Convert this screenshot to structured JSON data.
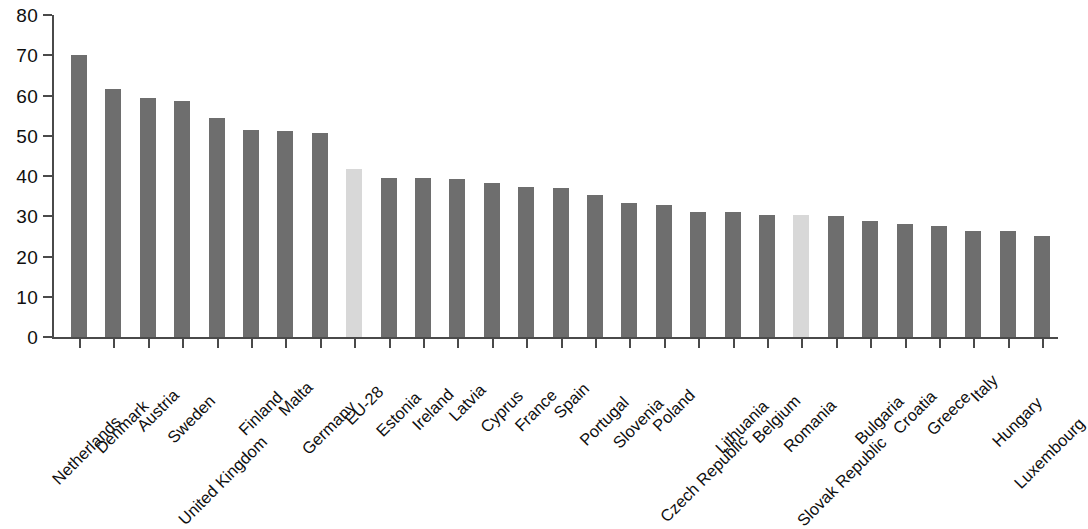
{
  "chart_data": {
    "type": "bar",
    "title": "",
    "subtitle": "",
    "xlabel": "",
    "ylabel": "",
    "ylim": [
      0,
      80
    ],
    "ytick_labels": [
      "0",
      "10",
      "20",
      "30",
      "40",
      "50",
      "60",
      "70",
      "80"
    ],
    "yticks": [
      0,
      10,
      20,
      30,
      40,
      50,
      60,
      70,
      80
    ],
    "grid": false,
    "legend": null,
    "legend_position": "none",
    "orientation": "vertical",
    "categories": [
      "Netherlands",
      "Denmark",
      "Austria",
      "Sweden",
      "United Kingdom",
      "Finland",
      "Malta",
      "Germany",
      "EU-28",
      "Estonia",
      "Ireland",
      "Latvia",
      "Cyprus",
      "France",
      "Spain",
      "Portugal",
      "Slovenia",
      "Poland",
      "Czech Republic",
      "Lithuania",
      "Belgium",
      "Romania",
      "Slovak Republic",
      "Bulgaria",
      "Croatia",
      "Greece",
      "Italy",
      "Hungary",
      "Luxembourg"
    ],
    "values": [
      70.0,
      61.6,
      59.3,
      58.7,
      54.3,
      51.4,
      51.3,
      50.6,
      41.8,
      39.5,
      39.4,
      39.2,
      38.2,
      37.3,
      37.0,
      35.4,
      33.4,
      32.8,
      31.0,
      31.0,
      30.4,
      30.2,
      30.1,
      28.9,
      28.1,
      27.6,
      26.3,
      26.3,
      25.2
    ],
    "highlighted_categories": [
      "EU-28",
      "Romania"
    ],
    "colors": {
      "bar_default": "#6e6e6e",
      "bar_highlight": "#d8d8d8",
      "axis": "#4a4a4a",
      "text": "#0f0f0f",
      "background": "#ffffff"
    }
  }
}
